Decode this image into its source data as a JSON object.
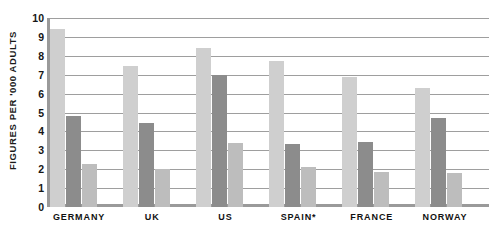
{
  "chart_data": {
    "type": "bar",
    "title": "",
    "xlabel": "",
    "ylabel": "FIGURES PER '000 ADULTS",
    "ylim": [
      0,
      10
    ],
    "yticks": [
      "10",
      "9",
      "8",
      "7",
      "6",
      "5",
      "4",
      "3",
      "2",
      "1",
      "0"
    ],
    "grid": true,
    "legend": "none",
    "categories": [
      "GERMANY",
      "UK",
      "US",
      "SPAIN*",
      "FRANCE",
      "NORWAY"
    ],
    "series": [
      {
        "name": "series-1-pale",
        "color": "#e2e2e2",
        "values": [
          1.0,
          1.0,
          2.2,
          0.5,
          0.45,
          0.4
        ]
      },
      {
        "name": "series-2-light",
        "color": "#cfcfcf",
        "values": [
          9.4,
          7.45,
          8.4,
          7.75,
          6.9,
          6.3
        ]
      },
      {
        "name": "series-3-dark",
        "color": "#8c8c8c",
        "values": [
          4.8,
          4.45,
          7.0,
          3.35,
          3.45,
          4.7
        ]
      },
      {
        "name": "series-4-mid",
        "color": "#bdbdbd",
        "values": [
          2.25,
          2.0,
          3.4,
          2.1,
          1.85,
          1.8
        ]
      }
    ],
    "footnote_marker": "*",
    "colors": {
      "pale": "#e2e2e2",
      "light": "#cfcfcf",
      "dark": "#8c8c8c",
      "mid": "#bdbdbd",
      "axis": "#9a9a9a",
      "gridline": "#9e9e9e",
      "text": "#111111",
      "background": "#ffffff"
    }
  }
}
